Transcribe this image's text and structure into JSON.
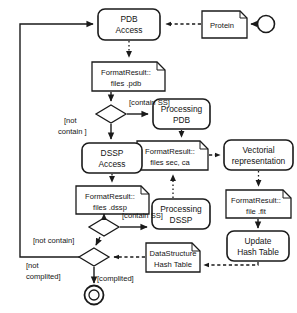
{
  "diagram": {
    "type": "uml-activity-diagram",
    "colors": {
      "stroke": "#1a1a1a",
      "fill": "#ffffff",
      "text": "#141414"
    },
    "nodes": {
      "start": {
        "kind": "initial-node",
        "label": ""
      },
      "protein": {
        "kind": "artifact",
        "label": "Protein"
      },
      "pdb_access": {
        "kind": "activity",
        "line1": "PDB",
        "line2": "Access"
      },
      "format_pdb": {
        "kind": "artifact",
        "line1": "FormatResult::",
        "line2": "files .pdb"
      },
      "decision_ss_pdb": {
        "kind": "decision",
        "label": ""
      },
      "processing_pdb": {
        "kind": "activity",
        "line1": "Processing",
        "line2": "PDB"
      },
      "format_sec_ca": {
        "kind": "artifact",
        "line1": "FormatResult::",
        "line2": "files sec, ca"
      },
      "dssp_access": {
        "kind": "activity",
        "line1": "DSSP",
        "line2": "Access"
      },
      "format_dssp": {
        "kind": "artifact",
        "line1": "FormatResult::",
        "line2": "files .dssp"
      },
      "decision_ss_dssp": {
        "kind": "decision",
        "label": ""
      },
      "processing_dssp": {
        "kind": "activity",
        "line1": "Processing",
        "line2": "DSSP"
      },
      "vectorial": {
        "kind": "activity",
        "line1": "Vectorial",
        "line2": "representation"
      },
      "format_flt": {
        "kind": "artifact",
        "line1": "FormatResult::",
        "line2": "file .flt"
      },
      "update_hash": {
        "kind": "activity",
        "line1": "Update",
        "line2": "Hash Table"
      },
      "data_structure": {
        "kind": "artifact",
        "line1": "DataStructure",
        "line2": "Hash Table"
      },
      "decision_complited": {
        "kind": "decision",
        "label": ""
      },
      "end": {
        "kind": "final-node",
        "label": ""
      }
    },
    "guards": {
      "contain_ss_pdb": "[contain SS]",
      "not_contain_line1": "[not",
      "not_contain_line2": "contain ]",
      "contain_ss_dssp": "[contain SS]",
      "not_contain_single": "[not contain]",
      "not_complited_line1": "[not",
      "not_complited_line2": "complited]",
      "complited": "[complited]"
    }
  }
}
